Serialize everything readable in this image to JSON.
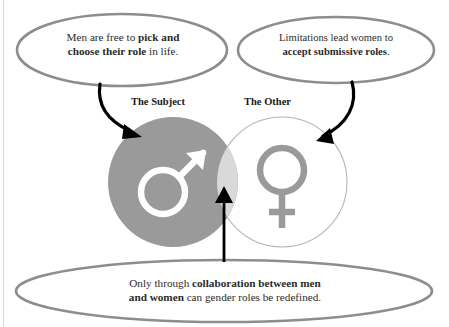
{
  "diagram": {
    "title_hidden": "",
    "colors": {
      "male_circle_fill": "#9a9a9a",
      "female_circle_stroke": "#b4b4b4",
      "intersection_fill": "#d9d9d9",
      "male_symbol": "#ffffff",
      "female_symbol": "#9a9a9a",
      "bubble_stroke": "#8d8d8d",
      "arrow": "#000000",
      "text": "#2b2b2b",
      "background": "#ffffff"
    },
    "labels": {
      "subject": "The Subject",
      "other": "The Other"
    },
    "icons": {
      "male": "mars-symbol-icon",
      "female": "venus-symbol-icon"
    },
    "bubbles": {
      "left": {
        "name": "speech-bubble-men",
        "line1_plain": "Men are free to ",
        "line1_bold": "pick and",
        "line2_bold": "choose their role",
        "line2_plain": " in life."
      },
      "right": {
        "name": "speech-bubble-women",
        "line1_plain": "Limitations lead women to",
        "line2_bold": "accept submissive roles",
        "line2_tail": "."
      },
      "bottom": {
        "name": "speech-bubble-collaboration",
        "line1_plain": "Only through ",
        "line1_bold": "collaboration between men",
        "line2_bold": "and women",
        "line2_plain": " can gender roles be redefined."
      }
    },
    "arrows": [
      {
        "name": "arrow-to-male-circle",
        "from": "speech-bubble-men",
        "to": "male-circle"
      },
      {
        "name": "arrow-to-female-circle",
        "from": "speech-bubble-women",
        "to": "female-circle"
      },
      {
        "name": "arrow-to-intersection",
        "from": "speech-bubble-collaboration",
        "to": "intersection"
      }
    ]
  }
}
